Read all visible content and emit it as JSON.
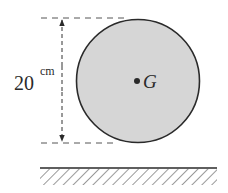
{
  "diagram": {
    "type": "disk-on-ground",
    "disk": {
      "fill": "#d6d6d6",
      "stroke": "#2a2a2a",
      "center_label": "G"
    },
    "dimension": {
      "value": "20",
      "unit": "cm",
      "measures": "diameter"
    },
    "ground": {
      "style": "hatched"
    }
  }
}
